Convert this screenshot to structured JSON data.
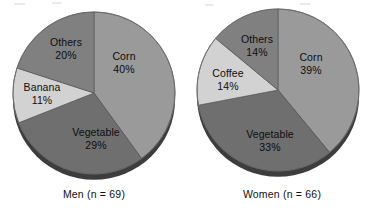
{
  "figure": {
    "background_color": "#ffffff",
    "label_text_color": "#0d0d0d",
    "caption_text_color": "#111111"
  },
  "palette": {
    "corn": "#9a9a9a",
    "vegetable": "#6f6f6f",
    "banana": "#d2d2d2",
    "coffee": "#d2d2d2",
    "others": "#808080",
    "rim_shadow": "#3d3d3d",
    "edge_line": "#5a5a5a"
  },
  "charts": [
    {
      "id": "men",
      "caption": "Men (n = 69)",
      "center": {
        "x": 94,
        "y": 93
      },
      "radius": 81,
      "slices": [
        {
          "name": "Corn",
          "label": "Corn",
          "percent_label": "40%",
          "value": 40,
          "color": "#9a9a9a",
          "label_x": 124,
          "label_y": 62
        },
        {
          "name": "Vegetable",
          "label": "Vegetable",
          "percent_label": "29%",
          "value": 29,
          "color": "#6f6f6f",
          "label_x": 96,
          "label_y": 138
        },
        {
          "name": "Banana",
          "label": "Banana",
          "percent_label": "11%",
          "value": 11,
          "color": "#d2d2d2",
          "label_x": 42,
          "label_y": 93
        },
        {
          "name": "Others",
          "label": "Others",
          "percent_label": "20%",
          "value": 20,
          "color": "#808080",
          "label_x": 66,
          "label_y": 48
        }
      ]
    },
    {
      "id": "women",
      "caption": "Women (n = 66)",
      "center": {
        "x": 90,
        "y": 90
      },
      "radius": 81,
      "slices": [
        {
          "name": "Corn",
          "label": "Corn",
          "percent_label": "39%",
          "value": 39,
          "color": "#9a9a9a",
          "label_x": 123,
          "label_y": 63
        },
        {
          "name": "Vegetable",
          "label": "Vegetable",
          "percent_label": "33%",
          "value": 33,
          "color": "#6f6f6f",
          "label_x": 82,
          "label_y": 140
        },
        {
          "name": "Coffee",
          "label": "Coffee",
          "percent_label": "14%",
          "value": 14,
          "color": "#d2d2d2",
          "label_x": 40,
          "label_y": 79
        },
        {
          "name": "Others",
          "label": "Others",
          "percent_label": "14%",
          "value": 14,
          "color": "#808080",
          "label_x": 69,
          "label_y": 45
        }
      ]
    }
  ],
  "chart_data": [
    {
      "type": "pie",
      "title": "Men (n = 69)",
      "categories": [
        "Corn",
        "Vegetable",
        "Banana",
        "Others"
      ],
      "values": [
        40,
        29,
        11,
        20
      ],
      "value_unit": "percent",
      "data_labels": [
        "40%",
        "29%",
        "11%",
        "20%"
      ],
      "colors": [
        "#9a9a9a",
        "#6f6f6f",
        "#d2d2d2",
        "#808080"
      ],
      "start_angle_deg": 0,
      "direction": "clockwise",
      "legend": "none",
      "labels_position": "inside-slice",
      "sample_size": 69,
      "xlabel": "",
      "ylabel": ""
    },
    {
      "type": "pie",
      "title": "Women (n = 66)",
      "categories": [
        "Corn",
        "Vegetable",
        "Coffee",
        "Others"
      ],
      "values": [
        39,
        33,
        14,
        14
      ],
      "value_unit": "percent",
      "data_labels": [
        "39%",
        "33%",
        "14%",
        "14%"
      ],
      "colors": [
        "#9a9a9a",
        "#6f6f6f",
        "#d2d2d2",
        "#808080"
      ],
      "start_angle_deg": 0,
      "direction": "clockwise",
      "legend": "none",
      "labels_position": "inside-slice",
      "sample_size": 66,
      "xlabel": "",
      "ylabel": ""
    }
  ]
}
